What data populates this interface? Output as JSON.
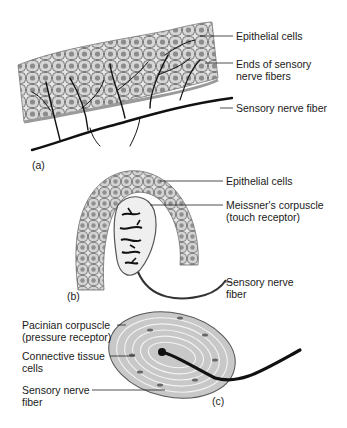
{
  "figure": {
    "panels": [
      {
        "id": "a",
        "label": "(a)",
        "callouts": [
          {
            "line1": "Epithelial cells",
            "line2": ""
          },
          {
            "line1": "Ends of sensory",
            "line2": "nerve fibers"
          },
          {
            "line1": "Sensory nerve fiber",
            "line2": ""
          }
        ]
      },
      {
        "id": "b",
        "label": "(b)",
        "callouts": [
          {
            "line1": "Epithelial cells",
            "line2": ""
          },
          {
            "line1": "Meissner's corpuscle",
            "line2": "(touch receptor)"
          },
          {
            "line1": "Sensory nerve",
            "line2": "fiber"
          }
        ]
      },
      {
        "id": "c",
        "label": "(c)",
        "callouts": [
          {
            "line1": "Pacinian corpuscle",
            "line2": "(pressure receptor)"
          },
          {
            "line1": "Connective tissue",
            "line2": "cells"
          },
          {
            "line1": "Sensory nerve",
            "line2": "fiber"
          }
        ]
      }
    ],
    "colors": {
      "cell_fill": "#d9d9d9",
      "nucleus": "#8a8a8a",
      "nerve": "#111111",
      "capsule": "#bdbdbd"
    }
  }
}
